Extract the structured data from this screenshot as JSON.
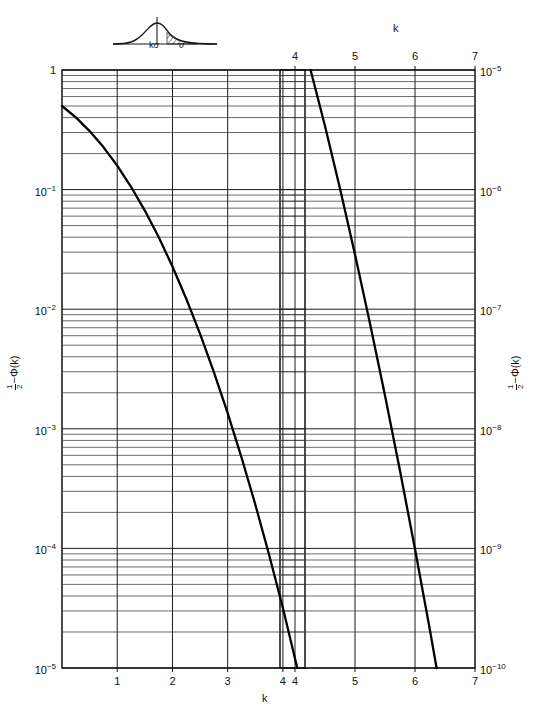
{
  "figure": {
    "type": "semilog-nomogram",
    "x_axis_label_top": "k",
    "x_axis_label_bottom": "k",
    "y_axis_label_left": "1/2 - Φ(k)",
    "y_axis_label_right": "1/2 - Φ(k)",
    "y_label_parts": {
      "frac_num": "1",
      "frac_den": "2",
      "minus": "−",
      "phi": "Φ(k)"
    }
  },
  "inset": {
    "name": "gaussian-tail-sketch",
    "label_threshold": "kσ",
    "label_tail": "υ"
  },
  "left_panel": {
    "x_ticks": [
      "1",
      "2",
      "3",
      "4"
    ],
    "x_tick_values": [
      1,
      2,
      3,
      4
    ],
    "x_range": [
      0,
      4.4
    ],
    "y_labels": [
      "1",
      "10⁻¹",
      "10⁻²",
      "10⁻³",
      "10⁻⁴",
      "10⁻⁵"
    ],
    "y_label_bases": [
      "1",
      "10",
      "10",
      "10",
      "10",
      "10"
    ],
    "y_label_exps": [
      "",
      "-1",
      "-2",
      "-3",
      "-4",
      "-5"
    ],
    "y_range_exp": [
      0,
      -5
    ]
  },
  "right_panel": {
    "x_ticks": [
      "4",
      "5",
      "6",
      "7"
    ],
    "x_tick_values": [
      4,
      5,
      6,
      7
    ],
    "x_range": [
      3.75,
      7
    ],
    "y_labels": [
      "10⁻⁵",
      "10⁻⁶",
      "10⁻⁷",
      "10⁻⁸",
      "10⁻⁹",
      "10⁻¹⁰"
    ],
    "y_label_bases": [
      "10",
      "10",
      "10",
      "10",
      "10",
      "10"
    ],
    "y_label_exps": [
      "-5",
      "-6",
      "-7",
      "-8",
      "-9",
      "-10"
    ],
    "y_range_exp": [
      -5,
      -10
    ]
  },
  "chart_data": {
    "type": "line",
    "title": "",
    "subtitle": "",
    "xlabel": "k",
    "ylabel": "1/2 - Φ(k)",
    "xlim": [
      0,
      7
    ],
    "ylim_exp": [
      0,
      -10
    ],
    "grid": true,
    "log_y": true,
    "legend": "none",
    "annotations": [
      {
        "text": "kσ",
        "where": "inset-threshold"
      },
      {
        "text": "υ",
        "where": "inset-tail"
      }
    ],
    "series": [
      {
        "name": "1/2 - Phi(k) : left panel (1 to 1e-5)",
        "panel": "left",
        "x": [
          0.0,
          0.25,
          0.5,
          0.75,
          1.0,
          1.25,
          1.5,
          1.75,
          2.0,
          2.25,
          2.5,
          2.75,
          3.0,
          3.25,
          3.5,
          3.75,
          4.0,
          4.26
        ],
        "y": [
          0.5,
          0.4013,
          0.3085,
          0.2266,
          0.1587,
          0.1056,
          0.0668,
          0.0401,
          0.02275,
          0.01222,
          0.00621,
          0.00298,
          0.00135,
          0.000577,
          0.000233,
          8.84e-05,
          3.17e-05,
          1e-05
        ]
      },
      {
        "name": "1/2 - Phi(k) : right panel (1e-5 to 1e-10)",
        "panel": "right",
        "x": [
          4.26,
          4.5,
          4.75,
          5.0,
          5.25,
          5.5,
          5.75,
          6.0,
          6.25,
          6.36
        ],
        "y": [
          1e-05,
          3.4e-06,
          1.02e-06,
          2.87e-07,
          7.61e-08,
          1.9e-08,
          4.46e-09,
          9.87e-10,
          2.06e-10,
          1e-10
        ]
      }
    ]
  },
  "colors": {
    "curve": "#000000",
    "grid_major": "#1c1c1c",
    "grid_minor": "#3a3a3a",
    "frame": "#000000",
    "text": "#111111",
    "background": "#ffffff"
  }
}
